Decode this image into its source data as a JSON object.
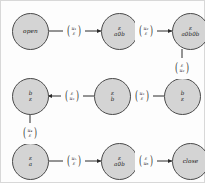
{
  "diagram": {
    "node_fill": "#d4d4d4",
    "node_stroke": "#4a4a4a",
    "background": "#fdfdfd",
    "nodes": [
      {
        "id": "n1",
        "name": "state-open",
        "top": "open",
        "bottom": ""
      },
      {
        "id": "n2",
        "name": "state-eps-a0b",
        "top": "ε",
        "bottom": "a0b"
      },
      {
        "id": "n3",
        "name": "state-eps-a0b0b",
        "top": "ε",
        "bottom": "a0b0b"
      },
      {
        "id": "n4",
        "name": "state-b-eps-r",
        "top": "b",
        "bottom": "ε"
      },
      {
        "id": "n5",
        "name": "state-eps-b",
        "top": "ε",
        "bottom": "b"
      },
      {
        "id": "n6",
        "name": "state-b-eps-l",
        "top": "b",
        "bottom": "ε"
      },
      {
        "id": "n7",
        "name": "state-eps-a",
        "top": "ε",
        "bottom": "a"
      },
      {
        "id": "n8",
        "name": "state-eps-a0b-2",
        "top": "ε",
        "bottom": "a0b"
      },
      {
        "id": "n9",
        "name": "state-close",
        "top": "close",
        "bottom": ""
      }
    ],
    "edges": [
      {
        "id": "e1",
        "name": "edge-open-to-a0b",
        "num": "u₁",
        "den": "ε"
      },
      {
        "id": "e2",
        "name": "edge-a0b-to-a0b0b",
        "num": "u₂",
        "den": "ε"
      },
      {
        "id": "e3",
        "name": "edge-a0b0b-to-b-down",
        "num": "ε",
        "den": "u₂"
      },
      {
        "id": "e4",
        "name": "edge-b-to-epsb",
        "num": "u₃",
        "den": "ε"
      },
      {
        "id": "e5",
        "name": "edge-epsb-to-b",
        "num": "ε",
        "den": "u₃"
      },
      {
        "id": "e6",
        "name": "edge-b-to-epsa-down",
        "num": "u₄",
        "den": "ε"
      },
      {
        "id": "e7",
        "name": "edge-epsa-to-a0b",
        "num": "u₅",
        "den": "ε"
      },
      {
        "id": "e8",
        "name": "edge-a0b-to-close",
        "num": "ε",
        "den": "u₆"
      }
    ]
  }
}
